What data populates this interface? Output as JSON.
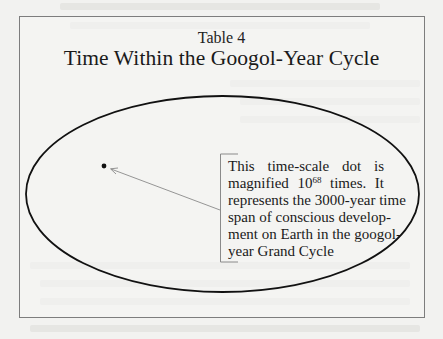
{
  "figure": {
    "label": "Table 4",
    "title": "Time Within the Googol-Year Cycle"
  },
  "diagram": {
    "shape": "ellipse",
    "represents": "googol-year Grand Cycle",
    "dot": {
      "description": "time-scale dot",
      "x": 104,
      "y": 166
    },
    "callout": {
      "lines": [
        {
          "text": "This time-scale dot is"
        },
        {
          "pre": "magnified 10",
          "sup": "68",
          "post": " times. It"
        },
        {
          "text": "represents the 3000-year time"
        },
        {
          "text": "span of conscious develop-"
        },
        {
          "text": "ment on Earth in the googol-"
        },
        {
          "text": "year Grand Cycle"
        }
      ],
      "full_text": "This time-scale dot is magnified 10^68 times. It represents the 3000-year time span of conscious development on Earth in the googol-year Grand Cycle"
    }
  },
  "colors": {
    "background": "#f2f2f0",
    "ink": "#1a1a1a",
    "frame": "#7d7d7d",
    "arrow": "#8a8a8a"
  }
}
